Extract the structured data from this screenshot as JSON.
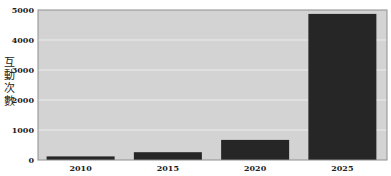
{
  "chart_data": {
    "type": "bar",
    "title": "",
    "xlabel": "",
    "ylabel": "互動次數",
    "categories": [
      "2010",
      "2015",
      "2020",
      "2025"
    ],
    "values": [
      120,
      260,
      670,
      4870
    ],
    "ylim": [
      0,
      5000
    ],
    "yticks": [
      0,
      1000,
      2000,
      3000,
      4000,
      5000
    ],
    "grid": true,
    "legend": null,
    "colors": {
      "bar": "#262626",
      "plot_background": "#d3d3d3",
      "grid": "#ececec"
    }
  }
}
